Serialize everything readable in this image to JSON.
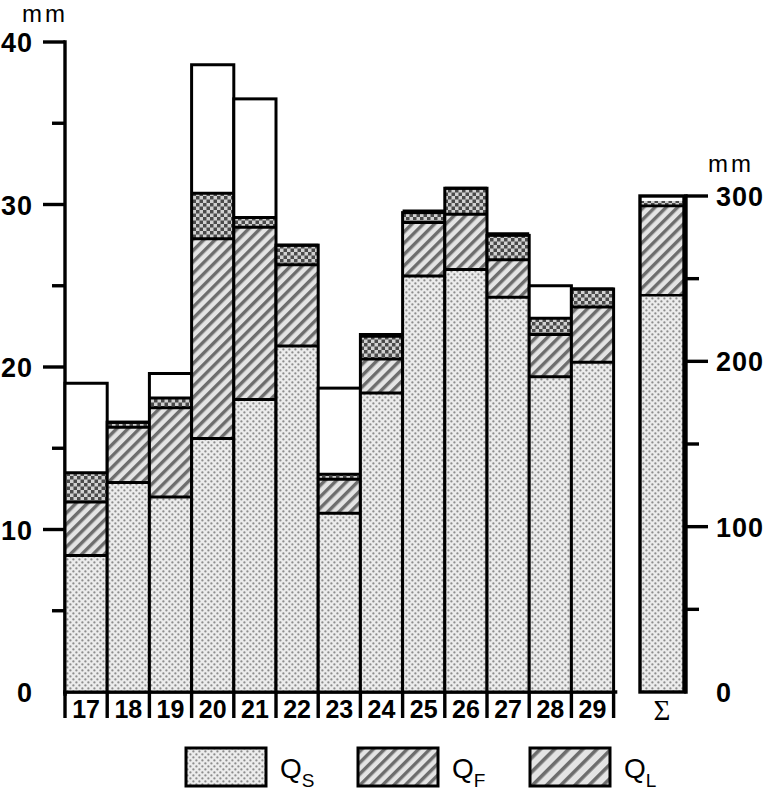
{
  "chart_data": {
    "type": "bar",
    "subtype": "stacked-bar",
    "title": "",
    "xlabel": "",
    "ylabel": "mm",
    "left_axis": {
      "unit": "mm",
      "min": 0,
      "max": 40,
      "major_ticks": [
        0,
        10,
        20,
        30,
        40
      ],
      "major_tick_labels": [
        "0",
        "10",
        "20",
        "30",
        "40"
      ],
      "minor_ticks": [
        5,
        15,
        25,
        35
      ],
      "grid": false
    },
    "right_axis": {
      "unit": "mm",
      "min": 0,
      "max": 300,
      "major_ticks": [
        0,
        100,
        200,
        300
      ],
      "major_tick_labels": [
        "0",
        "100",
        "200",
        "300"
      ],
      "minor_ticks": [
        50,
        150,
        250
      ],
      "grid": false
    },
    "categories": [
      "17",
      "18",
      "19",
      "20",
      "21",
      "22",
      "23",
      "24",
      "25",
      "26",
      "27",
      "28",
      "29"
    ],
    "series": [
      {
        "name": "QS",
        "label": "Q",
        "sub": "S",
        "fill": "dots",
        "values": [
          8.4,
          12.9,
          12.0,
          15.6,
          18.0,
          21.3,
          11.0,
          18.4,
          25.6,
          26.0,
          24.3,
          19.4,
          20.3
        ]
      },
      {
        "name": "QF",
        "label": "Q",
        "sub": "F",
        "fill": "hatch",
        "values": [
          3.3,
          3.4,
          5.5,
          12.3,
          10.6,
          5.0,
          2.1,
          2.1,
          3.3,
          3.4,
          2.3,
          2.6,
          3.4
        ]
      },
      {
        "name": "QL",
        "label": "Q",
        "sub": "L",
        "fill": "crosshatch",
        "values": [
          1.8,
          0.3,
          0.6,
          2.8,
          0.6,
          1.2,
          0.3,
          1.4,
          0.7,
          1.6,
          1.6,
          1.0,
          1.1
        ]
      },
      {
        "name": "Total",
        "label": "total",
        "sub": "",
        "fill": "none",
        "values": [
          19.0,
          16.6,
          19.6,
          38.6,
          36.5,
          27.5,
          18.7,
          22.0,
          29.5,
          31.0,
          28.1,
          25.0,
          24.8
        ]
      }
    ],
    "sum_bar": {
      "label": "Σ",
      "scale_max": 300,
      "QS": 240,
      "QF": 54,
      "QL": 3,
      "total": 300
    },
    "legend": {
      "position": "bottom",
      "entries": [
        {
          "label": "Q",
          "sub": "S",
          "fill": "dots"
        },
        {
          "label": "Q",
          "sub": "F",
          "fill": "hatch"
        },
        {
          "label": "Q",
          "sub": "L",
          "fill": "hatch-wide"
        }
      ]
    }
  },
  "labels": {
    "top_unit_left": "mm",
    "top_unit_right": "mm",
    "sigma": "Σ"
  }
}
